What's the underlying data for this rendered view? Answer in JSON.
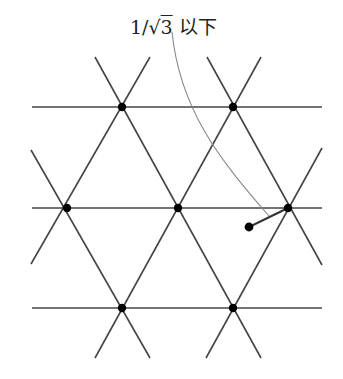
{
  "label": {
    "prefix": "1/",
    "radical": "√",
    "radicand": "3",
    "suffix": " 以下"
  },
  "colors": {
    "lines": "#444444",
    "nodes": "#000000",
    "leader": "#888888"
  },
  "lattice": {
    "rows": [
      {
        "y": 107,
        "x1": 32,
        "x2": 322,
        "nodes": [
          122,
          233
        ]
      },
      {
        "y": 208,
        "x1": 32,
        "x2": 322,
        "nodes": [
          67,
          178,
          288
        ]
      },
      {
        "y": 308,
        "x1": 32,
        "x2": 322,
        "nodes": [
          122,
          233
        ]
      }
    ],
    "diagonals": [
      [
        95,
        57,
        150,
        152
      ],
      [
        150,
        57,
        67,
        200
      ],
      [
        207,
        57,
        322,
        256
      ],
      [
        261,
        57,
        95,
        358
      ],
      [
        31,
        144,
        150,
        358
      ],
      [
        31,
        271,
        122,
        107
      ],
      [
        122,
        107,
        261,
        358
      ],
      [
        233,
        107,
        322,
        148
      ],
      [
        233,
        107,
        206,
        358
      ],
      [
        322,
        268,
        233,
        107
      ],
      [
        178,
        208,
        95,
        358
      ],
      [
        178,
        208,
        261,
        358
      ]
    ]
  },
  "point": {
    "x": 249,
    "y": 227
  },
  "nearest_node": {
    "x": 288,
    "y": 208
  }
}
